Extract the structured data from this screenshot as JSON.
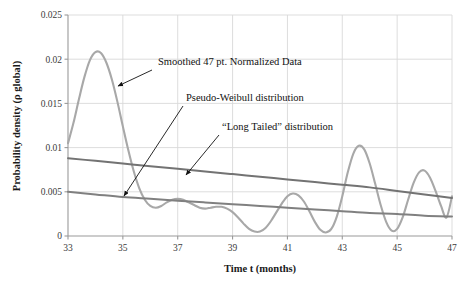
{
  "chart_data": {
    "type": "line",
    "title": "",
    "xlabel": "Time t (months)",
    "ylabel": "Probability density (ρ global)",
    "xlim": [
      33,
      47
    ],
    "ylim": [
      0,
      0.025
    ],
    "xticks": [
      "33",
      "35",
      "37",
      "39",
      "41",
      "43",
      "45",
      "47"
    ],
    "xtick_values": [
      33,
      35,
      37,
      39,
      41,
      43,
      45,
      47
    ],
    "yticks": [
      "0",
      "0.005",
      "0.01",
      "0.015",
      "0.02",
      "0.025"
    ],
    "ytick_values": [
      0,
      0.005,
      0.01,
      0.015,
      0.02,
      0.025
    ],
    "grid": true,
    "legend_position": "none",
    "series": [
      {
        "name": "Smoothed 47 pt. Normalized Data",
        "color": "#a8a8a8",
        "width": 2.1,
        "x": [
          33.0,
          33.2,
          33.4,
          33.6,
          33.8,
          34.0,
          34.2,
          34.4,
          34.6,
          34.8,
          35.0,
          35.2,
          35.4,
          35.6,
          35.8,
          36.0,
          36.2,
          36.4,
          36.6,
          36.8,
          37.0,
          37.2,
          37.4,
          37.6,
          37.8,
          38.0,
          38.2,
          38.4,
          38.6,
          38.8,
          39.0,
          39.2,
          39.4,
          39.6,
          39.8,
          40.0,
          40.2,
          40.4,
          40.6,
          40.8,
          41.0,
          41.2,
          41.4,
          41.6,
          41.8,
          42.0,
          42.2,
          42.4,
          42.6,
          42.8,
          43.0,
          43.2,
          43.4,
          43.6,
          43.8,
          44.0,
          44.2,
          44.4,
          44.6,
          44.8,
          45.0,
          45.2,
          45.4,
          45.6,
          45.8,
          46.0,
          46.2,
          46.4,
          46.6,
          46.8,
          47.0
        ],
        "y": [
          0.0105,
          0.0128,
          0.0155,
          0.018,
          0.0199,
          0.0208,
          0.0207,
          0.0196,
          0.0177,
          0.0152,
          0.0124,
          0.0097,
          0.0073,
          0.0054,
          0.0041,
          0.0034,
          0.0032,
          0.0034,
          0.0038,
          0.0041,
          0.0042,
          0.0041,
          0.0038,
          0.0035,
          0.0032,
          0.0031,
          0.0032,
          0.0033,
          0.0033,
          0.0031,
          0.0027,
          0.0021,
          0.0014,
          0.0008,
          0.0005,
          0.0005,
          0.0009,
          0.0017,
          0.0027,
          0.0037,
          0.0045,
          0.0048,
          0.0046,
          0.0039,
          0.0028,
          0.0016,
          0.0007,
          0.0004,
          0.0008,
          0.0022,
          0.0045,
          0.0072,
          0.0093,
          0.0102,
          0.0098,
          0.0082,
          0.0059,
          0.0035,
          0.0016,
          0.0006,
          0.0008,
          0.0021,
          0.0041,
          0.006,
          0.0072,
          0.0074,
          0.0066,
          0.0051,
          0.0034,
          0.0021,
          0.0045
        ]
      },
      {
        "name": "Pseudo-Weibull distribution",
        "color": "#737373",
        "width": 2.0,
        "x": [
          33.0,
          34.0,
          35.0,
          36.0,
          37.0,
          38.0,
          39.0,
          40.0,
          41.0,
          42.0,
          43.0,
          44.0,
          45.0,
          46.0,
          47.0
        ],
        "y": [
          0.0088,
          0.0085,
          0.0082,
          0.0079,
          0.0076,
          0.0073,
          0.007,
          0.0067,
          0.0064,
          0.0061,
          0.0058,
          0.0055,
          0.0051,
          0.0047,
          0.0043
        ]
      },
      {
        "name": "“Long Tailed” distribution",
        "color": "#808080",
        "width": 2.0,
        "x": [
          33.0,
          34.0,
          35.0,
          36.0,
          37.0,
          38.0,
          39.0,
          40.0,
          41.0,
          42.0,
          43.0,
          44.0,
          45.0,
          46.0,
          47.0
        ],
        "y": [
          0.005,
          0.0047,
          0.0044,
          0.0042,
          0.004,
          0.0038,
          0.0036,
          0.0034,
          0.0032,
          0.003,
          0.0028,
          0.0026,
          0.0025,
          0.0023,
          0.0022
        ]
      }
    ],
    "annotations": [
      {
        "id": "smoothed-data",
        "text": "Smoothed 47 pt. Normalized Data",
        "text_x": 158,
        "text_y": 65,
        "arrow_from_x": 152,
        "arrow_from_y": 70,
        "arrow_to_x": 118,
        "arrow_to_y": 86
      },
      {
        "id": "pseudo-weibull",
        "text": "Pseudo-Weibull distribution",
        "text_x": 186,
        "text_y": 101,
        "arrow_from_x": 183,
        "arrow_from_y": 106,
        "arrow_to_x": 124,
        "arrow_to_y": 196
      },
      {
        "id": "long-tailed",
        "text": "“Long Tailed” distribution",
        "text_x": 222,
        "text_y": 130,
        "arrow_from_x": 219,
        "arrow_from_y": 135,
        "arrow_to_x": 186,
        "arrow_to_y": 175
      }
    ]
  }
}
